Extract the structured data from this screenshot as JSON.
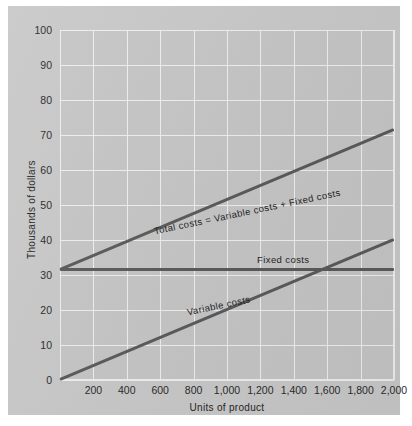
{
  "chart_data": {
    "type": "line",
    "title": "",
    "xlabel": "Units of product",
    "ylabel": "Thousands of dollars",
    "xlim": [
      0,
      2000
    ],
    "ylim": [
      0,
      100
    ],
    "grid": true,
    "legend": "inline-annotations",
    "x_ticks": [
      "200",
      "400",
      "600",
      "800",
      "1,000",
      "1,200",
      "1,400",
      "1,600",
      "1,800",
      "2,000"
    ],
    "x_tick_values": [
      200,
      400,
      600,
      800,
      1000,
      1200,
      1400,
      1600,
      1800,
      2000
    ],
    "y_ticks": [
      "0",
      "10",
      "20",
      "30",
      "40",
      "50",
      "60",
      "70",
      "80",
      "90",
      "100"
    ],
    "y_tick_values": [
      0,
      10,
      20,
      30,
      40,
      50,
      60,
      70,
      80,
      90,
      100
    ],
    "series": [
      {
        "name": "Total costs = Variable costs + Fixed costs",
        "label": "Total costs = Variable costs + Fixed costs",
        "x": [
          0,
          2000
        ],
        "values": [
          31.5,
          71.5
        ],
        "color": "#5b5b5b"
      },
      {
        "name": "Fixed costs",
        "label": "Fixed costs",
        "x": [
          0,
          2000
        ],
        "values": [
          31.5,
          31.5
        ],
        "color": "#5b5b5b"
      },
      {
        "name": "Variable costs",
        "label": "Variable costs",
        "x": [
          0,
          2000
        ],
        "values": [
          0,
          40
        ],
        "color": "#5b5b5b"
      }
    ],
    "annotations": [
      {
        "text": "Total costs = Variable costs + Fixed costs",
        "at_x": 560,
        "at_y": 42.5,
        "rotation": -11.8
      },
      {
        "text": "Fixed costs",
        "at_x": 1180,
        "at_y": 34.5,
        "rotation": 0
      },
      {
        "text": "Variable costs",
        "at_x": 760,
        "at_y": 19.5,
        "rotation": -11.8
      }
    ],
    "notes": {
      "breakeven_x": 1600,
      "breakeven_y": 31.5,
      "plot_background": "#c6c6c6",
      "panel_background": "#c9c9c9",
      "gridline_color": "#efefef",
      "line_color": "#5b5b5b"
    }
  }
}
